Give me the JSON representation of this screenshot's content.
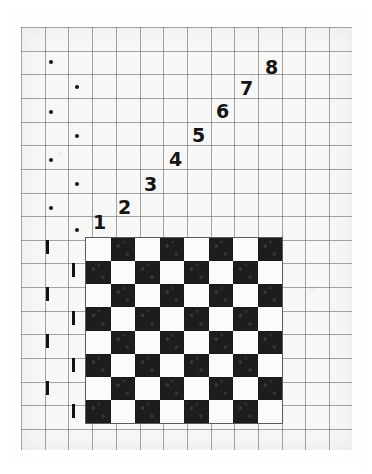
{
  "figure": {
    "paper_color": "#f7f7f5",
    "grid_line_color": "#5a5c68",
    "ink_color": "#151515",
    "dark_square_color": "#1d1d1d",
    "light_square_color": "#fbfbfa"
  },
  "board": {
    "name": "checkerboard",
    "rows": 8,
    "columns": 8,
    "top_left_square": "light",
    "cell_size_px": 24.6,
    "left_px": 85,
    "top_px": 237,
    "width_px": 198,
    "height_px": 187
  },
  "staircase": {
    "label": "diagonal step numbers",
    "count": 8,
    "steps": [
      {
        "label": "1",
        "x": 93,
        "y": 213
      },
      {
        "label": "2",
        "x": 118,
        "y": 198
      },
      {
        "label": "3",
        "x": 144,
        "y": 175
      },
      {
        "label": "4",
        "x": 169,
        "y": 150
      },
      {
        "label": "5",
        "x": 192,
        "y": 126
      },
      {
        "label": "6",
        "x": 216,
        "y": 102
      },
      {
        "label": "7",
        "x": 240,
        "y": 79
      },
      {
        "label": "8",
        "x": 265,
        "y": 58
      }
    ]
  },
  "margin_marks": {
    "dots": {
      "label": "row dots",
      "count": 8,
      "items": [
        {
          "x": 49,
          "y": 60
        },
        {
          "x": 75,
          "y": 85
        },
        {
          "x": 49,
          "y": 110
        },
        {
          "x": 75,
          "y": 134
        },
        {
          "x": 49,
          "y": 158
        },
        {
          "x": 75,
          "y": 182
        },
        {
          "x": 49,
          "y": 206
        },
        {
          "x": 75,
          "y": 228
        }
      ]
    },
    "ticks": {
      "label": "row tick marks",
      "count": 8,
      "items": [
        {
          "x": 46,
          "y": 240
        },
        {
          "x": 72,
          "y": 263
        },
        {
          "x": 46,
          "y": 287
        },
        {
          "x": 72,
          "y": 311
        },
        {
          "x": 46,
          "y": 334
        },
        {
          "x": 72,
          "y": 358
        },
        {
          "x": 46,
          "y": 381
        },
        {
          "x": 72,
          "y": 404
        }
      ]
    }
  }
}
